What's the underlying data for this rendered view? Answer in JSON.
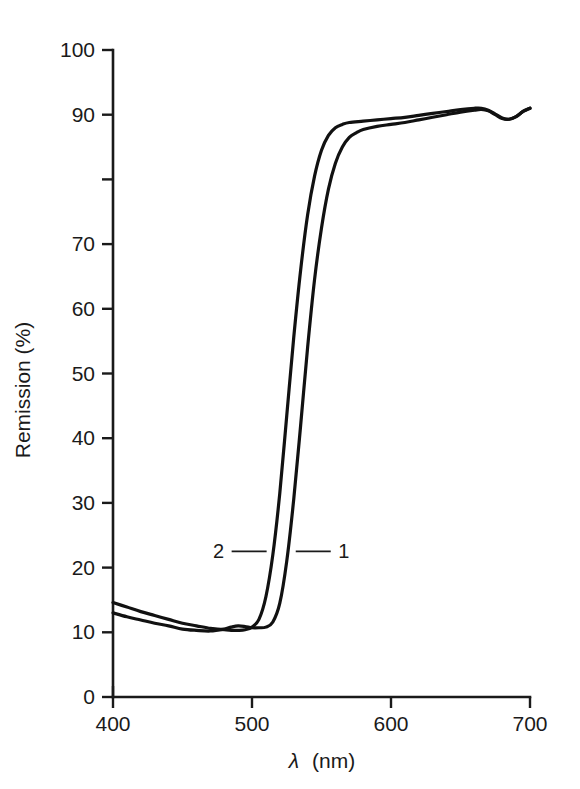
{
  "chart_data": {
    "type": "line",
    "title": "",
    "subtitle": "",
    "xlabel": "λ (nm)",
    "xlabel_symbol": "λ",
    "xlabel_unit": "(nm)",
    "ylabel": "Remission (%)",
    "xlim": [
      400,
      700
    ],
    "ylim": [
      0,
      100
    ],
    "grid": false,
    "legend": "inline-labels",
    "x_ticks": [
      400,
      500,
      600,
      700
    ],
    "x_tick_labels": [
      "400",
      "500",
      "600",
      "700"
    ],
    "y_ticks": [
      0,
      10,
      20,
      30,
      40,
      50,
      60,
      70,
      80,
      90,
      100
    ],
    "y_tick_labels": [
      "0",
      "10",
      "20",
      "30",
      "40",
      "50",
      "60",
      "70",
      "",
      "90",
      "100"
    ],
    "annotations": [
      {
        "text": "1",
        "x": 566,
        "y": 22.5,
        "points_to": "curve-1"
      },
      {
        "text": "2",
        "x": 476,
        "y": 22.5,
        "points_to": "curve-2"
      }
    ],
    "series": [
      {
        "name": "1",
        "label": "1",
        "color": "#111111",
        "x": [
          400,
          410,
          420,
          430,
          440,
          450,
          460,
          470,
          480,
          485,
          490,
          495,
          500,
          505,
          510,
          515,
          520,
          525,
          530,
          535,
          540,
          545,
          550,
          555,
          560,
          565,
          570,
          575,
          580,
          590,
          600,
          610,
          620,
          630,
          640,
          650,
          660,
          665,
          670,
          675,
          680,
          685,
          690,
          695,
          700
        ],
        "y": [
          13.0,
          12.4,
          11.9,
          11.4,
          11.0,
          10.5,
          10.3,
          10.2,
          10.5,
          10.8,
          11.0,
          10.9,
          10.7,
          10.7,
          10.8,
          11.6,
          14.5,
          21.0,
          30.5,
          42.0,
          54.0,
          64.5,
          72.5,
          78.5,
          82.5,
          85.0,
          86.5,
          87.2,
          87.7,
          88.2,
          88.5,
          88.8,
          89.2,
          89.6,
          90.0,
          90.4,
          90.7,
          90.8,
          90.6,
          90.0,
          89.4,
          89.3,
          89.7,
          90.5,
          91.0
        ]
      },
      {
        "name": "2",
        "label": "2",
        "color": "#111111",
        "x": [
          400,
          410,
          420,
          430,
          440,
          450,
          460,
          470,
          475,
          480,
          485,
          490,
          495,
          500,
          505,
          510,
          515,
          520,
          525,
          530,
          535,
          540,
          545,
          550,
          555,
          560,
          565,
          570,
          580,
          590,
          600,
          610,
          620,
          630,
          640,
          650,
          660,
          665,
          670,
          675,
          680,
          685,
          690,
          695,
          700
        ],
        "y": [
          14.6,
          13.9,
          13.2,
          12.6,
          12.0,
          11.4,
          11.0,
          10.6,
          10.5,
          10.4,
          10.3,
          10.3,
          10.4,
          10.8,
          12.0,
          15.5,
          22.0,
          31.5,
          43.5,
          55.5,
          66.0,
          74.5,
          80.5,
          84.5,
          86.8,
          88.0,
          88.5,
          88.8,
          89.0,
          89.2,
          89.4,
          89.6,
          89.9,
          90.2,
          90.5,
          90.8,
          91.0,
          91.0,
          90.7,
          90.1,
          89.5,
          89.3,
          89.7,
          90.5,
          91.0
        ]
      }
    ]
  },
  "colors": {
    "background": "#ffffff",
    "axis": "#1a1a1a",
    "curve": "#111111"
  }
}
